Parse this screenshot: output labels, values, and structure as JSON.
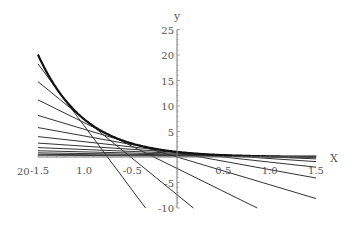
{
  "chart_data": {
    "type": "line",
    "title": "",
    "xlabel": "X",
    "ylabel": "y",
    "xlim": [
      -1.5,
      1.5
    ],
    "ylim": [
      -10,
      25
    ],
    "grid": false,
    "legend": null,
    "x_ticks": [
      {
        "value": -1.5,
        "label": "-1.5"
      },
      {
        "value": -1.0,
        "label": "1.0"
      },
      {
        "value": -0.5,
        "label": "-0.5"
      },
      {
        "value": 0.5,
        "label": "0.5"
      },
      {
        "value": 1.0,
        "label": "1.0"
      },
      {
        "value": 1.5,
        "label": "1.5"
      }
    ],
    "x_extra_label": "20",
    "y_ticks": [
      {
        "value": 25,
        "label": "25"
      },
      {
        "value": 20,
        "label": "20"
      },
      {
        "value": 15,
        "label": "15"
      },
      {
        "value": 10,
        "label": "10"
      },
      {
        "value": 5,
        "label": "5"
      },
      {
        "value": -5,
        "label": "-5"
      },
      {
        "value": -10,
        "label": "-10"
      }
    ],
    "series": [
      {
        "name": "curve y = e^(-2x)",
        "kind": "curve",
        "function": "exp(-2x)",
        "style": "thick"
      },
      {
        "name": "tangent lines",
        "kind": "tangents",
        "tangent_points": [
          -1.25,
          -1.0,
          -0.75,
          -0.5,
          -0.25,
          0,
          0.25,
          0.5,
          0.75,
          1.0,
          1.25,
          1.5
        ],
        "style": "thin"
      }
    ],
    "colors": {
      "curve": "#111111",
      "tangent": "#333333",
      "axis": "#777777",
      "text": "#555555"
    }
  }
}
